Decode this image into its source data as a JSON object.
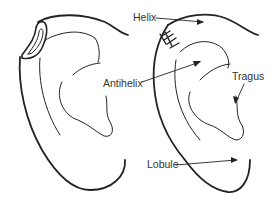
{
  "diagram": {
    "title": "",
    "left_figure": "ear-with-piercing-cyst",
    "right_figure": "ear-anatomy-labeled",
    "line_color": "#222222",
    "labels": [
      {
        "id": "helix",
        "text": "Helix",
        "x": 133,
        "y": 12
      },
      {
        "id": "antihelix",
        "text": "Antihelix",
        "x": 103,
        "y": 78
      },
      {
        "id": "tragus",
        "text": "Tragus",
        "x": 232,
        "y": 71
      },
      {
        "id": "lobule",
        "text": "Lobule",
        "x": 147,
        "y": 159
      }
    ]
  }
}
